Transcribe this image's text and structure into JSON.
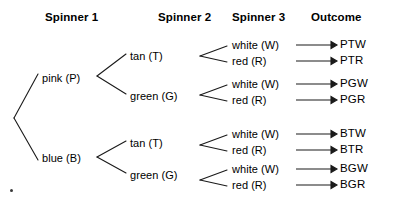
{
  "headers": [
    {
      "label": "Spinner 1",
      "x": 45,
      "y": 11
    },
    {
      "label": "Spinner 2",
      "x": 158,
      "y": 11
    },
    {
      "label": "Spinner 3",
      "x": 232,
      "y": 11
    },
    {
      "label": "Outcome",
      "x": 311,
      "y": 11
    }
  ],
  "spinner1": [
    {
      "label": "pink (P)",
      "x": 42,
      "y": 72
    },
    {
      "label": "blue (B)",
      "x": 42,
      "y": 152
    }
  ],
  "spinner2": [
    {
      "label": "tan (T)",
      "x": 130,
      "y": 50,
      "parent": "pink (P)"
    },
    {
      "label": "green (G)",
      "x": 130,
      "y": 90,
      "parent": "pink (P)"
    },
    {
      "label": "tan (T)",
      "x": 130,
      "y": 137,
      "parent": "blue (B)"
    },
    {
      "label": "green (G)",
      "x": 130,
      "y": 169,
      "parent": "blue (B)"
    }
  ],
  "spinner3": [
    {
      "label": "white (W)",
      "x": 232,
      "y": 42
    },
    {
      "label": "red (R)",
      "x": 232,
      "y": 58
    },
    {
      "label": "white (W)",
      "x": 232,
      "y": 81
    },
    {
      "label": "red (R)",
      "x": 232,
      "y": 97
    },
    {
      "label": "white (W)",
      "x": 232,
      "y": 131
    },
    {
      "label": "red (R)",
      "x": 232,
      "y": 147
    },
    {
      "label": "white (W)",
      "x": 232,
      "y": 166
    },
    {
      "label": "red (R)",
      "x": 232,
      "y": 182
    }
  ],
  "outcomes": [
    {
      "label": "PTW",
      "x": 340,
      "y": 41
    },
    {
      "label": "PTR",
      "x": 340,
      "y": 57
    },
    {
      "label": "PGW",
      "x": 340,
      "y": 80
    },
    {
      "label": "PGR",
      "x": 340,
      "y": 96
    },
    {
      "label": "BTW",
      "x": 340,
      "y": 130
    },
    {
      "label": "BTR",
      "x": 340,
      "y": 146
    },
    {
      "label": "BGW",
      "x": 340,
      "y": 165
    },
    {
      "label": "BGR",
      "x": 340,
      "y": 181
    }
  ],
  "tree_structure": {
    "type": "probability-tree",
    "levels": [
      "Spinner 1",
      "Spinner 2",
      "Spinner 3",
      "Outcome"
    ],
    "branches": [
      {
        "path": [
          "pink (P)",
          "tan (T)",
          "white (W)"
        ],
        "outcome": "PTW"
      },
      {
        "path": [
          "pink (P)",
          "tan (T)",
          "red (R)"
        ],
        "outcome": "PTR"
      },
      {
        "path": [
          "pink (P)",
          "green (G)",
          "white (W)"
        ],
        "outcome": "PGW"
      },
      {
        "path": [
          "pink (P)",
          "green (G)",
          "red (R)"
        ],
        "outcome": "PGR"
      },
      {
        "path": [
          "blue (B)",
          "tan (T)",
          "white (W)"
        ],
        "outcome": "BTW"
      },
      {
        "path": [
          "blue (B)",
          "tan (T)",
          "red (R)"
        ],
        "outcome": "BTR"
      },
      {
        "path": [
          "blue (B)",
          "green (G)",
          "white (W)"
        ],
        "outcome": "BGW"
      },
      {
        "path": [
          "blue (B)",
          "green (G)",
          "red (R)"
        ],
        "outcome": "BGR"
      }
    ],
    "total_outcomes": 8
  },
  "colors": {
    "background": "#ffffff",
    "text": "#000000",
    "line": "#1a1a1a"
  }
}
